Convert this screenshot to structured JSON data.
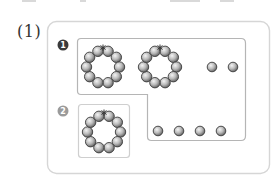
{
  "problem": {
    "label": "(1)"
  },
  "groups": [
    {
      "marker": "1",
      "marker_color": "#3a3a3a",
      "rings": 2,
      "beads_per_ring": 10,
      "loose_beads": 6
    },
    {
      "marker": "2",
      "marker_color": "#9a9a9a",
      "rings": 1,
      "beads_per_ring": 10,
      "loose_beads": 0
    }
  ],
  "colors": {
    "outer_border": "#d6d6d6",
    "inner_border": "#b5b5b5",
    "bead_light": "#eeeeee",
    "bead_dark": "#6b6b6b",
    "bead_stroke": "#3c3c3c"
  }
}
